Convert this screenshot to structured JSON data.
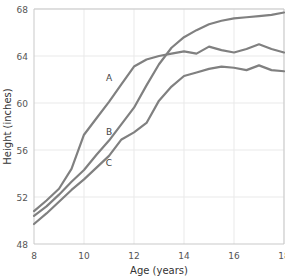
{
  "chart_data": {
    "type": "line",
    "title": "",
    "xlabel": "Age (years)",
    "ylabel": "Height (inches)",
    "xlim": [
      8,
      18
    ],
    "ylim": [
      48,
      68
    ],
    "xticks": [
      8,
      10,
      12,
      14,
      16,
      18
    ],
    "yticks": [
      48,
      52,
      56,
      60,
      64,
      68
    ],
    "xtick_labels": [
      "8",
      "10",
      "12",
      "14",
      "16",
      "18"
    ],
    "ytick_labels": [
      "48",
      "52",
      "56",
      "60",
      "64",
      "68"
    ],
    "grid": true,
    "legend": "inline-labels",
    "line_color": "#808080",
    "x": [
      8,
      8.5,
      9,
      9.5,
      10,
      10.5,
      11,
      11.5,
      12,
      12.5,
      13,
      13.5,
      14,
      14.5,
      15,
      15.5,
      16,
      16.5,
      17,
      17.5,
      18
    ],
    "series": [
      {
        "name": "A",
        "label": "A",
        "label_x": 11.0,
        "label_y": 61.9,
        "values": [
          50.8,
          51.7,
          52.7,
          54.4,
          57.3,
          58.7,
          60.1,
          61.6,
          63.1,
          63.7,
          64.0,
          64.2,
          64.4,
          64.2,
          64.8,
          64.5,
          64.3,
          64.6,
          65.0,
          64.6,
          64.3
        ]
      },
      {
        "name": "B",
        "label": "B",
        "label_x": 11.0,
        "label_y": 57.3,
        "values": [
          50.4,
          51.2,
          52.2,
          53.3,
          54.3,
          55.6,
          56.8,
          58.2,
          59.6,
          61.5,
          63.3,
          64.7,
          65.6,
          66.2,
          66.7,
          67.0,
          67.2,
          67.3,
          67.4,
          67.5,
          67.7
        ]
      },
      {
        "name": "C",
        "label": "C",
        "label_x": 11.0,
        "label_y": 54.6,
        "values": [
          49.7,
          50.6,
          51.6,
          52.6,
          53.5,
          54.5,
          55.5,
          56.9,
          57.5,
          58.3,
          60.2,
          61.4,
          62.3,
          62.6,
          62.9,
          63.1,
          63.0,
          62.8,
          63.2,
          62.8,
          62.7
        ]
      }
    ]
  },
  "axes": {
    "xlabel": "Age (years)",
    "ylabel": "Height (inches)"
  }
}
